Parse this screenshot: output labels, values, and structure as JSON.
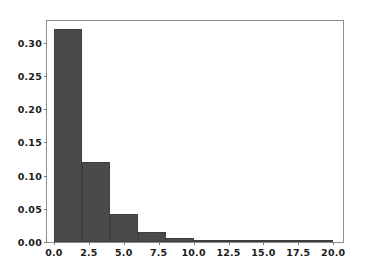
{
  "chart_data": {
    "type": "bar",
    "subtype": "histogram",
    "title": "",
    "xlabel": "",
    "ylabel": "",
    "xlim": [
      -0.5,
      20.7
    ],
    "ylim": [
      0.0,
      0.3325
    ],
    "grid": false,
    "legend": null,
    "bin_width": 2.0,
    "bin_edges": [
      0,
      2,
      4,
      6,
      8,
      10,
      12,
      14,
      16,
      18,
      20
    ],
    "categories": [
      "0-2",
      "2-4",
      "4-6",
      "6-8",
      "8-10",
      "10-12",
      "12-14",
      "14-16",
      "16-18",
      "18-20"
    ],
    "values": [
      0.32,
      0.12,
      0.042,
      0.015,
      0.006,
      0.002,
      0.0006,
      0.0003,
      0.0002,
      0.0001
    ],
    "bar_color": "#4a4a4a",
    "edge_color": "#3f3f3f",
    "background_color": "#ffffff",
    "spine_color": "#8d8d8d",
    "xticks": [
      {
        "value": 0.0,
        "label": "0.0"
      },
      {
        "value": 2.5,
        "label": "2.5"
      },
      {
        "value": 5.0,
        "label": "5.0"
      },
      {
        "value": 7.5,
        "label": "7.5"
      },
      {
        "value": 10.0,
        "label": "10.0"
      },
      {
        "value": 12.5,
        "label": "12.5"
      },
      {
        "value": 15.0,
        "label": "15.0"
      },
      {
        "value": 17.5,
        "label": "17.5"
      },
      {
        "value": 20.0,
        "label": "20.0"
      }
    ],
    "yticks": [
      {
        "value": 0.0,
        "label": "0.00"
      },
      {
        "value": 0.05,
        "label": "0.05"
      },
      {
        "value": 0.1,
        "label": "0.10"
      },
      {
        "value": 0.15,
        "label": "0.15"
      },
      {
        "value": 0.2,
        "label": "0.20"
      },
      {
        "value": 0.25,
        "label": "0.25"
      },
      {
        "value": 0.3,
        "label": "0.30"
      }
    ]
  }
}
